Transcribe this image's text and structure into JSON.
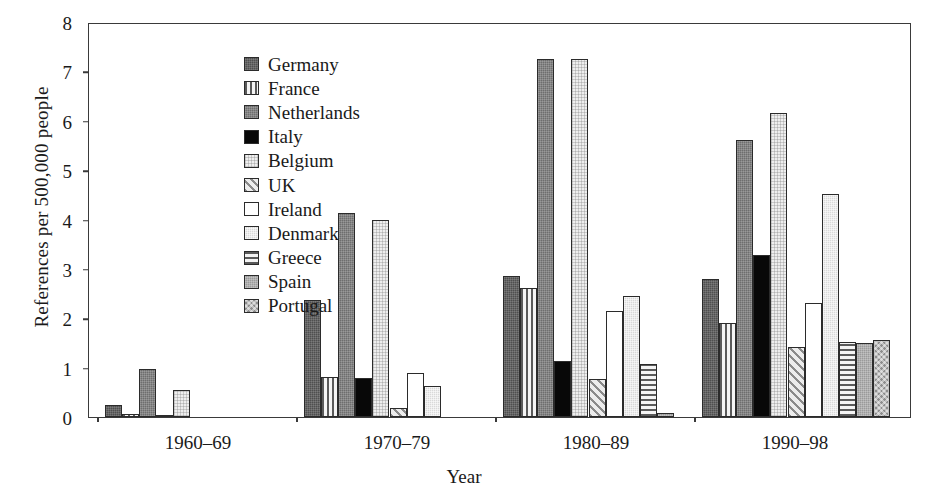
{
  "chart_data": {
    "type": "bar",
    "title": "",
    "subtitle": "",
    "xlabel": "Year",
    "ylabel": "References per 500,000 people",
    "categories": [
      "1960–69",
      "1970–79",
      "1980–89",
      "1990–98"
    ],
    "ylim": [
      0,
      8
    ],
    "ytick_labels": [
      "0",
      "1",
      "2",
      "3",
      "4",
      "5",
      "6",
      "7",
      "8"
    ],
    "ytick_values": [
      0,
      1,
      2,
      3,
      4,
      5,
      6,
      7,
      8
    ],
    "grid": false,
    "legend_position": "top-left-inside",
    "series": [
      {
        "name": "Germany",
        "pattern": "solid-dark-gray",
        "color": "#4f4f4f",
        "values": [
          0.25,
          2.38,
          2.85,
          2.8
        ]
      },
      {
        "name": "France",
        "pattern": "vertical-stripes",
        "color": "#f2f2f2",
        "values": [
          0.06,
          0.82,
          2.62,
          1.9
        ]
      },
      {
        "name": "Netherlands",
        "pattern": "solid-medium-gray",
        "color": "#6e6e6e",
        "values": [
          0.98,
          4.13,
          7.25,
          5.62
        ]
      },
      {
        "name": "Italy",
        "pattern": "solid-black",
        "color": "#080808",
        "values": [
          0.05,
          0.8,
          1.13,
          3.28
        ]
      },
      {
        "name": "Belgium",
        "pattern": "very-light-stipple",
        "color": "#eeeeee",
        "values": [
          0.55,
          4.0,
          7.25,
          6.15
        ]
      },
      {
        "name": "UK",
        "pattern": "diagonal-hatch",
        "color": "#e8e8e8",
        "values": [
          0.0,
          0.18,
          0.78,
          1.42
        ]
      },
      {
        "name": "Ireland",
        "pattern": "white",
        "color": "#ffffff",
        "values": [
          0.0,
          0.9,
          2.15,
          2.3
        ]
      },
      {
        "name": "Denmark",
        "pattern": "light-gray",
        "color": "#d9d9d9",
        "values": [
          0.0,
          0.62,
          2.45,
          4.52
        ]
      },
      {
        "name": "Greece",
        "pattern": "horizontal-stripes",
        "color": "#f2f2f2",
        "values": [
          0.0,
          0.0,
          1.08,
          1.52
        ]
      },
      {
        "name": "Spain",
        "pattern": "medium-gray",
        "color": "#9a9a9a",
        "values": [
          0.0,
          0.0,
          0.08,
          1.5
        ]
      },
      {
        "name": "Portugal",
        "pattern": "checkered",
        "color": "#8d8d8d",
        "values": [
          0.0,
          0.0,
          0.0,
          1.55
        ]
      }
    ]
  },
  "legend": {
    "items": [
      {
        "label": "Germany"
      },
      {
        "label": "France"
      },
      {
        "label": "Netherlands"
      },
      {
        "label": "Italy"
      },
      {
        "label": "Belgium"
      },
      {
        "label": "UK"
      },
      {
        "label": "Ireland"
      },
      {
        "label": "Denmark"
      },
      {
        "label": "Greece"
      },
      {
        "label": "Spain"
      },
      {
        "label": "Portugal"
      }
    ]
  },
  "axes": {
    "y_title": "References per 500,000 people",
    "x_title": "Year"
  }
}
